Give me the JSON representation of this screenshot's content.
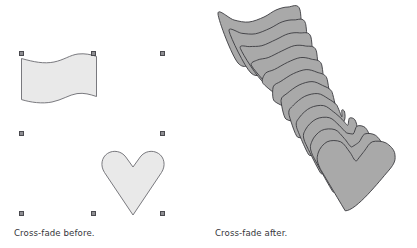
{
  "figure": {
    "background_color": "#ffffff",
    "panels": [
      {
        "id": "before",
        "caption": "Cross-fade before.",
        "shapes": [
          {
            "name": "wave-shape",
            "fill": "#e9e9e9",
            "stroke": "#6b6b70"
          },
          {
            "name": "heart-shape",
            "fill": "#e9e9e9",
            "stroke": "#6b6b70"
          }
        ],
        "selection_handles": [
          {
            "x": 19,
            "y": 51
          },
          {
            "x": 91,
            "y": 51
          },
          {
            "x": 160,
            "y": 51
          },
          {
            "x": 19,
            "y": 131
          },
          {
            "x": 160,
            "y": 131
          },
          {
            "x": 19,
            "y": 211
          },
          {
            "x": 91,
            "y": 211
          },
          {
            "x": 160,
            "y": 211
          }
        ]
      },
      {
        "id": "after",
        "caption": "Cross-fade after.",
        "blend_steps": 12,
        "shapes": [
          {
            "name": "blend-stack",
            "fill": "#a9a9a9",
            "stroke": "#3b3b3f"
          }
        ]
      }
    ]
  },
  "colors": {
    "shape_fill_light": "#e9e9e9",
    "shape_stroke_light": "#6b6b70",
    "shape_fill_blend": "#a9a9a9",
    "shape_stroke_blend": "#3b3b3f",
    "handle_fill": "#8f8f93",
    "handle_border": "#4a4a4f",
    "caption_text": "#35353a",
    "background": "#ffffff"
  }
}
